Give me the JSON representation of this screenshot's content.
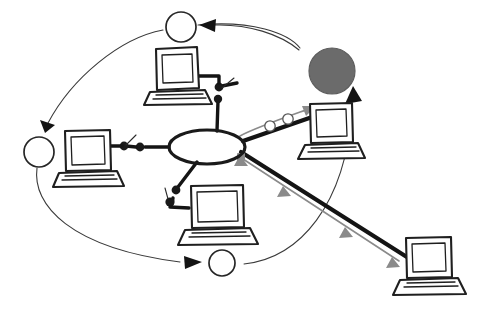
{
  "diagram": {
    "title": "Hand-drawn network topology diagram",
    "background_color": "#ffffff",
    "ink_color": "#1a1a1a",
    "accent_gray": "#6b6b6b",
    "flow_gray": "#8a8a8a",
    "canvas": {
      "width": 478,
      "height": 311
    }
  },
  "hub": {
    "label": "central-hub",
    "shape": "ellipse",
    "fill": "#ffffff",
    "stroke": "#141414",
    "cx": 207,
    "cy": 147,
    "rx": 38,
    "ry": 17
  },
  "nodes": [
    {
      "id": "node-top",
      "label": "top-open-node",
      "style": "open",
      "fill": "#ffffff",
      "cx": 181,
      "cy": 27,
      "r": 15
    },
    {
      "id": "node-left",
      "label": "left-open-node",
      "style": "open",
      "fill": "#ffffff",
      "cx": 39,
      "cy": 152,
      "r": 15
    },
    {
      "id": "node-bottom",
      "label": "bottom-open-node",
      "style": "open",
      "fill": "#ffffff",
      "cx": 222,
      "cy": 263,
      "r": 13
    },
    {
      "id": "node-gray",
      "label": "filled-gray-node",
      "style": "filled",
      "fill": "#6b6b6b",
      "cx": 332,
      "cy": 71,
      "r": 23
    }
  ],
  "laptops": [
    {
      "id": "laptop-top",
      "label": "top-laptop",
      "x": 155,
      "y": 48
    },
    {
      "id": "laptop-left",
      "label": "left-laptop",
      "x": 62,
      "y": 130
    },
    {
      "id": "laptop-bottom",
      "label": "bottom-center-laptop",
      "x": 188,
      "y": 185
    },
    {
      "id": "laptop-right",
      "label": "right-laptop",
      "x": 305,
      "y": 103
    },
    {
      "id": "laptop-bottom-right",
      "label": "bottom-right-laptop",
      "x": 403,
      "y": 237
    }
  ],
  "cables": [
    {
      "id": "cable-top",
      "label": "hub-to-top-laptop-cable",
      "from": "hub",
      "to": "laptop-top",
      "connectors": 2
    },
    {
      "id": "cable-left",
      "label": "hub-to-left-laptop-cable",
      "from": "hub",
      "to": "laptop-left",
      "connectors": 2
    },
    {
      "id": "cable-bottom",
      "label": "hub-to-bottom-laptop-cable",
      "from": "hub",
      "to": "laptop-bottom",
      "connectors": 2
    },
    {
      "id": "cable-right",
      "label": "hub-to-right-laptop-cable",
      "from": "hub",
      "to": "laptop-right",
      "connectors": 0
    },
    {
      "id": "cable-bottom-right",
      "label": "hub-to-bottom-right-laptop-cable",
      "from": "hub",
      "to": "laptop-bottom-right",
      "connectors": 1
    }
  ],
  "flows": [
    {
      "id": "flow-right",
      "label": "packet-flow-to-right-laptop",
      "direction": "toward-right-laptop",
      "color": "#8a8a8a",
      "packet_rings": 2
    },
    {
      "id": "flow-bottom-right",
      "label": "packet-flow-to-bottom-right-laptop",
      "direction": "toward-bottom-right-laptop",
      "color": "#8a8a8a",
      "arrow_heads": 4
    }
  ],
  "loop_arrows": [
    {
      "id": "arc-top-left",
      "label": "arc-from-top-node-to-left-node",
      "from": "node-top",
      "to": "node-left",
      "color": "#3a3a3a"
    },
    {
      "id": "arc-left-bottom",
      "label": "arc-from-left-node-to-bottom-node",
      "from": "node-left",
      "to": "node-bottom",
      "color": "#3a3a3a"
    },
    {
      "id": "arc-bottom-gray",
      "label": "arc-from-bottom-right-to-gray-node",
      "from": "bottom-right-area",
      "to": "node-gray",
      "color": "#3a3a3a"
    },
    {
      "id": "arc-gray-top",
      "label": "arc-from-gray-node-area-to-top-node",
      "from": "node-gray",
      "to": "node-top",
      "color": "#3a3a3a"
    }
  ]
}
